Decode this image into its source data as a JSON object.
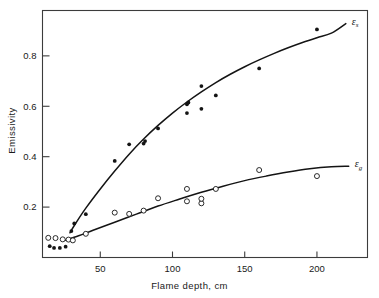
{
  "chart_data": {
    "type": "scatter",
    "title": "",
    "xlabel": "Flame depth, cm",
    "ylabel": "Emissivity",
    "xlim": [
      10,
      235
    ],
    "ylim": [
      0.0,
      0.98
    ],
    "xticks": [
      50,
      100,
      150,
      200
    ],
    "yticks": [
      0.2,
      0.4,
      0.6,
      0.8
    ],
    "xtick_labels": [
      "50",
      "100",
      "150",
      "200"
    ],
    "ytick_labels": [
      "0.2",
      "0.4",
      "0.6",
      "0.8"
    ],
    "grid": false,
    "legend_position": "inline-curve-end",
    "frame": "box",
    "series": [
      {
        "name": "soot-emissivity",
        "label": "ε",
        "label_subscript": "s",
        "marker": "filled-circle",
        "color": "#141414",
        "x": [
          15,
          18,
          22,
          26,
          30,
          32,
          40,
          60,
          70,
          80,
          81,
          90,
          110,
          110,
          111,
          120,
          120,
          130,
          160,
          200
        ],
        "y": [
          0.045,
          0.038,
          0.038,
          0.043,
          0.105,
          0.135,
          0.172,
          0.383,
          0.449,
          0.452,
          0.462,
          0.512,
          0.573,
          0.608,
          0.615,
          0.59,
          0.68,
          0.643,
          0.75,
          0.905
        ],
        "curve_x": [
          29,
          33,
          40,
          50,
          60,
          70,
          80,
          90,
          100,
          110,
          120,
          130,
          140,
          150,
          160,
          170,
          180,
          190,
          200,
          210,
          220
        ],
        "curve_y": [
          0.098,
          0.136,
          0.196,
          0.272,
          0.343,
          0.41,
          0.47,
          0.524,
          0.573,
          0.617,
          0.657,
          0.694,
          0.727,
          0.757,
          0.784,
          0.809,
          0.832,
          0.853,
          0.872,
          0.89,
          0.928
        ]
      },
      {
        "name": "gas-emissivity",
        "label": "ε",
        "label_subscript": "g",
        "marker": "open-circle",
        "color": "#141414",
        "x": [
          14,
          19,
          24,
          28,
          31,
          40,
          60,
          70,
          80,
          90,
          110,
          110,
          120,
          120,
          130,
          160,
          200
        ],
        "y": [
          0.078,
          0.077,
          0.072,
          0.071,
          0.068,
          0.094,
          0.178,
          0.173,
          0.186,
          0.235,
          0.223,
          0.272,
          0.215,
          0.233,
          0.272,
          0.347,
          0.323
        ],
        "curve_x": [
          26,
          35,
          45,
          60,
          75,
          90,
          105,
          120,
          135,
          150,
          165,
          180,
          195,
          210,
          222
        ],
        "curve_y": [
          0.069,
          0.086,
          0.108,
          0.14,
          0.172,
          0.204,
          0.232,
          0.259,
          0.283,
          0.305,
          0.323,
          0.339,
          0.352,
          0.36,
          0.362
        ]
      }
    ]
  }
}
